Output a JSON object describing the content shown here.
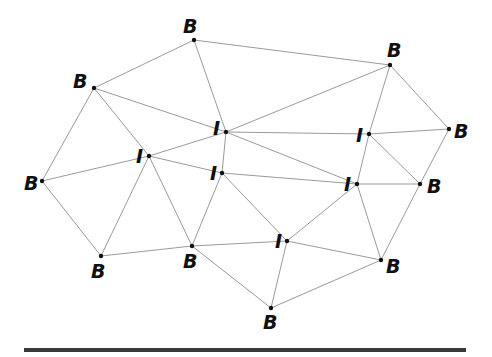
{
  "diagram": {
    "type": "graph",
    "nodes": [
      {
        "id": "B1",
        "label": "B",
        "kind": "boundary",
        "x": 194,
        "y": 40,
        "lx": 183,
        "ly": 33
      },
      {
        "id": "B2",
        "label": "B",
        "kind": "boundary",
        "x": 94,
        "y": 88,
        "lx": 73,
        "ly": 88
      },
      {
        "id": "B3",
        "label": "B",
        "kind": "boundary",
        "x": 390,
        "y": 65,
        "lx": 387,
        "ly": 57
      },
      {
        "id": "B4",
        "label": "B",
        "kind": "boundary",
        "x": 449,
        "y": 129,
        "lx": 454,
        "ly": 138
      },
      {
        "id": "B5",
        "label": "B",
        "kind": "boundary",
        "x": 42,
        "y": 181,
        "lx": 24,
        "ly": 190
      },
      {
        "id": "B6",
        "label": "B",
        "kind": "boundary",
        "x": 420,
        "y": 184,
        "lx": 427,
        "ly": 193
      },
      {
        "id": "B7",
        "label": "B",
        "kind": "boundary",
        "x": 101,
        "y": 256,
        "lx": 91,
        "ly": 278
      },
      {
        "id": "B8",
        "label": "B",
        "kind": "boundary",
        "x": 192,
        "y": 246,
        "lx": 183,
        "ly": 268
      },
      {
        "id": "B9",
        "label": "B",
        "kind": "boundary",
        "x": 381,
        "y": 260,
        "lx": 386,
        "ly": 273
      },
      {
        "id": "B10",
        "label": "B",
        "kind": "boundary",
        "x": 271,
        "y": 308,
        "lx": 263,
        "ly": 329
      },
      {
        "id": "I1",
        "label": "I",
        "kind": "interior",
        "x": 226,
        "y": 132,
        "lx": 213,
        "ly": 135
      },
      {
        "id": "I2",
        "label": "I",
        "kind": "interior",
        "x": 369,
        "y": 134,
        "lx": 356,
        "ly": 142
      },
      {
        "id": "I3",
        "label": "I",
        "kind": "interior",
        "x": 149,
        "y": 156,
        "lx": 136,
        "ly": 163
      },
      {
        "id": "I4",
        "label": "I",
        "kind": "interior",
        "x": 222,
        "y": 173,
        "lx": 210,
        "ly": 180
      },
      {
        "id": "I5",
        "label": "I",
        "kind": "interior",
        "x": 357,
        "y": 184,
        "lx": 344,
        "ly": 191
      },
      {
        "id": "I6",
        "label": "I",
        "kind": "interior",
        "x": 287,
        "y": 241,
        "lx": 275,
        "ly": 248
      }
    ],
    "edges": [
      [
        "B1",
        "B2"
      ],
      [
        "B1",
        "B3"
      ],
      [
        "B1",
        "I1"
      ],
      [
        "B2",
        "I1"
      ],
      [
        "B2",
        "I3"
      ],
      [
        "B2",
        "B5"
      ],
      [
        "B3",
        "I1"
      ],
      [
        "B3",
        "I2"
      ],
      [
        "B3",
        "B4"
      ],
      [
        "B4",
        "I2"
      ],
      [
        "B4",
        "B6"
      ],
      [
        "B6",
        "B9"
      ],
      [
        "I2",
        "B6"
      ],
      [
        "I2",
        "I5"
      ],
      [
        "I1",
        "I2"
      ],
      [
        "I1",
        "I3"
      ],
      [
        "I1",
        "I4"
      ],
      [
        "I1",
        "I5"
      ],
      [
        "I3",
        "B5"
      ],
      [
        "I3",
        "I4"
      ],
      [
        "I3",
        "B7"
      ],
      [
        "I3",
        "B8"
      ],
      [
        "B5",
        "B7"
      ],
      [
        "B7",
        "B8"
      ],
      [
        "I4",
        "B8"
      ],
      [
        "I4",
        "I5"
      ],
      [
        "I4",
        "I6"
      ],
      [
        "I5",
        "B6"
      ],
      [
        "I5",
        "B9"
      ],
      [
        "I5",
        "I6"
      ],
      [
        "B8",
        "I6"
      ],
      [
        "B8",
        "B10"
      ],
      [
        "I6",
        "B9"
      ],
      [
        "I6",
        "B10"
      ],
      [
        "B10",
        "B9"
      ]
    ]
  },
  "colors": {
    "edge": "#9a9a9a",
    "node": "#111111",
    "bar": "#3a3a3a"
  }
}
